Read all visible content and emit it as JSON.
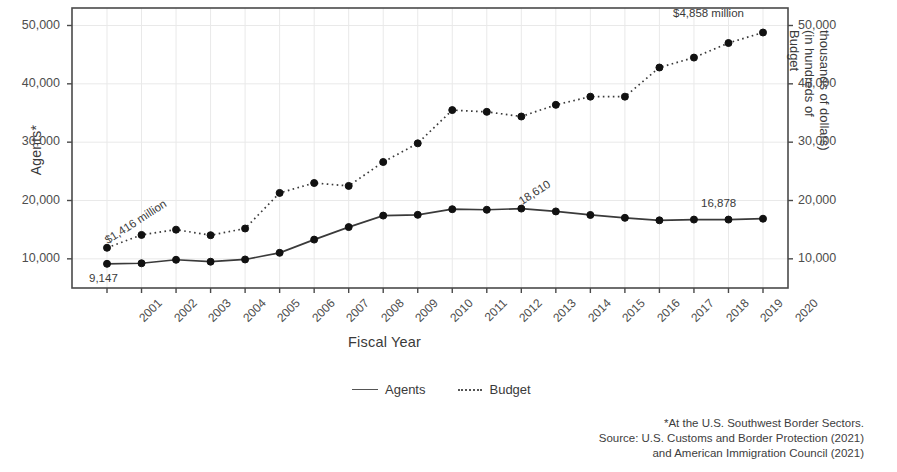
{
  "chart_data": {
    "type": "line",
    "title": "",
    "xlabel": "Fiscal Year",
    "ylabel": "Agents*",
    "ylabel_right": [
      "Budget",
      "(in hundreds of",
      "thousands of dollars)"
    ],
    "grid": true,
    "legend_position": "bottom",
    "ylim": [
      5000,
      53000
    ],
    "yticks": [
      "10,000",
      "20,000",
      "30,000",
      "40,000",
      "50,000"
    ],
    "ytick_values": [
      10000,
      20000,
      30000,
      40000,
      50000
    ],
    "yticks_right": [
      "10,000",
      "20,000",
      "30,000",
      "40,000",
      "50,000"
    ],
    "categories": [
      "2001",
      "2002",
      "2003",
      "2004",
      "2005",
      "2006",
      "2007",
      "2008",
      "2009",
      "2010",
      "2011",
      "2012",
      "2013",
      "2014",
      "2015",
      "2016",
      "2017",
      "2018",
      "2019",
      "2020"
    ],
    "series": [
      {
        "name": "Agents",
        "style": "solid",
        "values": [
          9147,
          9239,
          9840,
          9506,
          9891,
          11032,
          13297,
          15442,
          17415,
          17544,
          18506,
          18412,
          18610,
          18127,
          17522,
          17026,
          16605,
          16731,
          16731,
          16878
        ]
      },
      {
        "name": "Budget",
        "style": "dotted",
        "values": [
          11900,
          14100,
          15000,
          14050,
          15200,
          21300,
          23000,
          22500,
          26600,
          29800,
          35500,
          35200,
          34400,
          36400,
          37800,
          37800,
          42800,
          44500,
          47000,
          48800
        ]
      }
    ],
    "annotations": [
      {
        "text": "$1,416 million",
        "series": "Budget",
        "x": "2001",
        "rotated": true
      },
      {
        "text": "9,147",
        "series": "Agents",
        "x": "2001",
        "rotated": false
      },
      {
        "text": "18,610",
        "series": "Agents",
        "x": "2013",
        "rotated": true
      },
      {
        "text": "16,878",
        "series": "Agents",
        "x": "2020",
        "rotated": false
      },
      {
        "text": "$4,858 million",
        "series": "Budget",
        "x": "2020",
        "rotated": false
      }
    ],
    "legend": [
      "Agents",
      "Budget"
    ],
    "footnote": [
      "*At the U.S. Southwest Border Sectors.",
      "Source: U.S. Customs and Border Protection (2021)",
      "and American Immigration Council (2021)"
    ],
    "colors": {
      "line": "#3a3a3a",
      "marker": "#111111",
      "grid": "#e9e9e9",
      "frame": "#4a4a4a",
      "text": "#3d3d3d",
      "background": "#ffffff"
    }
  }
}
